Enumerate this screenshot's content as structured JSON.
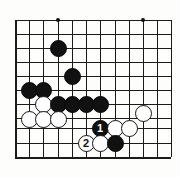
{
  "diagram": {
    "kind": "go-board-diagram",
    "board_size": 19,
    "view": {
      "columns_visible": 12,
      "rows_visible": 11,
      "origin_x": 15,
      "origin_y": 20,
      "spacing": 14.2,
      "edge": "bottom-left corner",
      "left_edge_is_board_edge": true,
      "bottom_edge_is_board_edge": true
    },
    "colors": {
      "line": "#1a1a1a",
      "black_stone": "#111111",
      "white_stone": "#ffffff",
      "white_stone_border": "#141414",
      "black_number_text": "#ffffff",
      "white_number_text": "#111111",
      "background": "#ffffff"
    },
    "grid": {
      "x_lines": [
        15,
        29,
        43,
        58,
        72,
        86,
        100,
        115,
        129,
        143,
        157,
        171
      ],
      "y_lines": [
        20,
        34,
        48,
        62,
        76,
        90,
        104,
        118,
        128,
        143,
        157
      ],
      "edge_lines": [
        "left",
        "bottom"
      ]
    },
    "star_points": [
      {
        "x": 58,
        "y": 20,
        "label": "hoshi-upper-left"
      },
      {
        "x": 143,
        "y": 20,
        "label": "hoshi-upper-right"
      }
    ],
    "stones": [
      {
        "id": "b1",
        "color": "black",
        "x": 58,
        "y": 48,
        "number": ""
      },
      {
        "id": "b2",
        "color": "black",
        "x": 72,
        "y": 76,
        "number": ""
      },
      {
        "id": "b3",
        "color": "black",
        "x": 29,
        "y": 90,
        "number": ""
      },
      {
        "id": "b4",
        "color": "black",
        "x": 43,
        "y": 90,
        "number": ""
      },
      {
        "id": "w1",
        "color": "white",
        "x": 43,
        "y": 104,
        "number": ""
      },
      {
        "id": "b5",
        "color": "black",
        "x": 58,
        "y": 104,
        "number": ""
      },
      {
        "id": "b6",
        "color": "black",
        "x": 72,
        "y": 104,
        "number": ""
      },
      {
        "id": "b7",
        "color": "black",
        "x": 86,
        "y": 104,
        "number": ""
      },
      {
        "id": "b8",
        "color": "black",
        "x": 100,
        "y": 104,
        "number": ""
      },
      {
        "id": "w2",
        "color": "white",
        "x": 143,
        "y": 113,
        "number": ""
      },
      {
        "id": "w3",
        "color": "white",
        "x": 29,
        "y": 119,
        "number": ""
      },
      {
        "id": "w4",
        "color": "white",
        "x": 43,
        "y": 119,
        "number": ""
      },
      {
        "id": "w5",
        "color": "white",
        "x": 58,
        "y": 119,
        "number": ""
      },
      {
        "id": "m1",
        "color": "black",
        "x": 100,
        "y": 128,
        "number": "1"
      },
      {
        "id": "w6",
        "color": "white",
        "x": 115,
        "y": 128,
        "number": ""
      },
      {
        "id": "w7",
        "color": "white",
        "x": 129,
        "y": 128,
        "number": ""
      },
      {
        "id": "m2",
        "color": "white",
        "x": 86,
        "y": 143,
        "number": "2"
      },
      {
        "id": "w8",
        "color": "white",
        "x": 100,
        "y": 143,
        "number": ""
      },
      {
        "id": "b9",
        "color": "black",
        "x": 115,
        "y": 143,
        "number": ""
      }
    ],
    "move_markers": [
      {
        "number": "1",
        "color": "black",
        "x": 100,
        "y": 128
      },
      {
        "number": "2",
        "color": "white",
        "x": 86,
        "y": 143
      }
    ]
  }
}
